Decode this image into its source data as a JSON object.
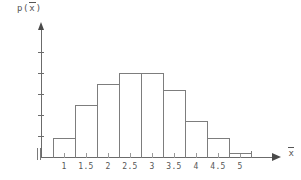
{
  "chart_data": {
    "type": "bar",
    "title": "",
    "subtitle": "",
    "xlabel": "x̄",
    "ylabel": "p(x̄)",
    "categories": [
      "1",
      "1.5",
      "2",
      "2.5",
      "3",
      "3.5",
      "4",
      "4.5",
      "5"
    ],
    "values": [
      0.045,
      0.125,
      0.175,
      0.2,
      0.2,
      0.16,
      0.085,
      0.045,
      0.01
    ],
    "bin_edges": [
      0.75,
      1.25,
      1.75,
      2.25,
      2.75,
      3.25,
      3.75,
      4.25,
      4.75,
      5.25
    ],
    "xlim": [
      0.75,
      5.25
    ],
    "ylim": [
      0,
      0.275
    ],
    "y_ticks": [
      ".05",
      ".10",
      ".15",
      ".20",
      ".25"
    ],
    "y_tick_values": [
      0.05,
      0.1,
      0.15,
      0.2,
      0.25
    ],
    "x_ticks": [
      "1",
      "1.5",
      "2",
      "2.5",
      "3",
      "3.5",
      "4",
      "4.5",
      "5"
    ],
    "x_tick_values": [
      1,
      1.5,
      2,
      2.5,
      3,
      3.5,
      4,
      4.5,
      5
    ],
    "grid": false,
    "legend": null,
    "axis_break": true,
    "line_color": "#7d7d7d",
    "axis_color": "#6b6b6b",
    "text_color": "#555555",
    "background": "#ffffff"
  },
  "axes": {
    "y_axis_label_base": "p(",
    "y_axis_label_var": "x",
    "y_axis_label_close": ")",
    "x_axis_label_var": "x"
  },
  "icons": {
    "y_axis_arrow": "arrow-up-icon",
    "x_axis_arrow": "arrow-right-icon",
    "axis_break": "axis-break-icon"
  }
}
